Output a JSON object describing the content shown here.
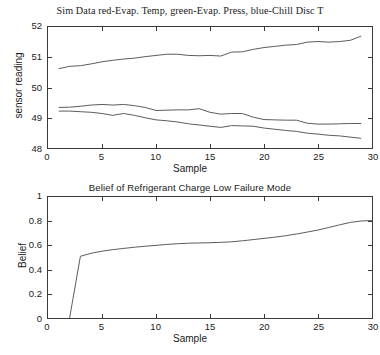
{
  "chart_data": [
    {
      "type": "line",
      "title": "Sim Data red-Evap. Temp, green-Evap. Press, blue-Chill Disc T",
      "xlabel": "Sample",
      "ylabel": "sensor reading",
      "xlim": [
        0,
        30
      ],
      "ylim": [
        48,
        52
      ],
      "xticks": [
        0,
        5,
        10,
        15,
        20,
        25,
        30
      ],
      "yticks": [
        48,
        49,
        50,
        51,
        52
      ],
      "grid": false,
      "legend": "none",
      "x": [
        1,
        2,
        3,
        4,
        5,
        6,
        7,
        8,
        9,
        10,
        11,
        12,
        13,
        14,
        15,
        16,
        17,
        18,
        19,
        20,
        21,
        22,
        23,
        24,
        25,
        26,
        27,
        28,
        29
      ],
      "series": [
        {
          "name": "Chill Disc T",
          "color": "#4a4a4a",
          "values": [
            50.62,
            50.7,
            50.72,
            50.78,
            50.85,
            50.9,
            50.94,
            50.97,
            51.02,
            51.06,
            51.1,
            51.1,
            51.06,
            51.05,
            51.06,
            51.04,
            51.17,
            51.18,
            51.26,
            51.32,
            51.36,
            51.4,
            51.42,
            51.5,
            51.52,
            51.5,
            51.52,
            51.56,
            51.7
          ]
        },
        {
          "name": "Evap. Temp",
          "color": "#4a4a4a",
          "values": [
            49.34,
            49.35,
            49.38,
            49.42,
            49.44,
            49.42,
            49.44,
            49.4,
            49.34,
            49.24,
            49.25,
            49.26,
            49.26,
            49.3,
            49.18,
            49.12,
            49.14,
            49.14,
            49.02,
            48.94,
            48.93,
            48.92,
            48.92,
            48.82,
            48.79,
            48.79,
            48.8,
            48.81,
            48.81
          ]
        },
        {
          "name": "Evap. Press",
          "color": "#4a4a4a",
          "values": [
            49.22,
            49.22,
            49.2,
            49.18,
            49.14,
            49.08,
            49.14,
            49.08,
            49.0,
            48.93,
            48.9,
            48.86,
            48.8,
            48.76,
            48.72,
            48.68,
            48.74,
            48.73,
            48.72,
            48.66,
            48.62,
            48.58,
            48.55,
            48.49,
            48.46,
            48.42,
            48.4,
            48.36,
            48.32
          ]
        }
      ]
    },
    {
      "type": "line",
      "title": "Belief of Refrigerant Charge Low Failure Mode",
      "xlabel": "Sample",
      "ylabel": "Belief",
      "xlim": [
        0,
        30
      ],
      "ylim": [
        0,
        1
      ],
      "xticks": [
        0,
        5,
        10,
        15,
        20,
        25,
        30
      ],
      "yticks": [
        0,
        0.2,
        0.4,
        0.6,
        0.8,
        1
      ],
      "grid": false,
      "legend": "none",
      "x": [
        2,
        3,
        4,
        5,
        6,
        7,
        8,
        9,
        10,
        11,
        12,
        13,
        14,
        15,
        16,
        17,
        18,
        19,
        20,
        21,
        22,
        23,
        24,
        25,
        26,
        27,
        28,
        29,
        30
      ],
      "series": [
        {
          "name": "Belief",
          "color": "#4a4a4a",
          "values": [
            0.0,
            0.51,
            0.535,
            0.552,
            0.565,
            0.575,
            0.585,
            0.593,
            0.6,
            0.608,
            0.614,
            0.618,
            0.62,
            0.622,
            0.625,
            0.63,
            0.638,
            0.648,
            0.658,
            0.668,
            0.68,
            0.694,
            0.71,
            0.727,
            0.748,
            0.77,
            0.79,
            0.802,
            0.805
          ]
        }
      ]
    }
  ],
  "figures": {
    "top": {
      "title": "Sim Data red-Evap. Temp, green-Evap. Press, blue-Chill Disc T",
      "xlabel": "Sample",
      "ylabel": "sensor reading",
      "ytick_labels": [
        "52",
        "51",
        "50",
        "49",
        "48"
      ],
      "xtick_labels": [
        "0",
        "5",
        "10",
        "15",
        "20",
        "25",
        "30"
      ]
    },
    "bottom": {
      "title": "Belief of Refrigerant Charge Low Failure Mode",
      "xlabel": "Sample",
      "ylabel": "Belief",
      "ytick_labels": [
        "1",
        "0.8",
        "0.6",
        "0.4",
        "0.2",
        "0"
      ],
      "xtick_labels": [
        "0",
        "5",
        "10",
        "15",
        "20",
        "25",
        "30"
      ]
    }
  },
  "colors": {
    "axis": "#3a3a3a",
    "line": "#4a4a4a",
    "background": "#ffffff",
    "text": "#1a1a1a"
  }
}
